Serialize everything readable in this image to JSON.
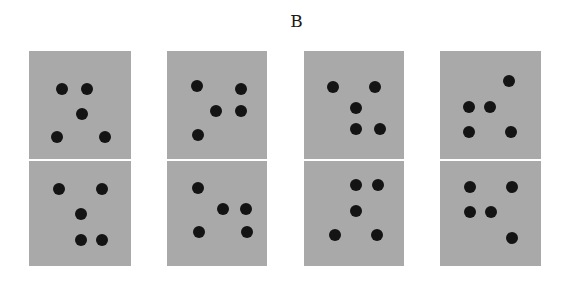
{
  "figure": {
    "label": "B",
    "panel_color": "#a9a9a9",
    "dot_color": "#141414",
    "background": "#ffffff",
    "dot_diameter": 12
  },
  "columns": [
    {
      "top": {
        "x": 29,
        "y": 51,
        "w": 102,
        "h": 108,
        "dots": [
          [
            62,
            89
          ],
          [
            87,
            89
          ],
          [
            82,
            114
          ],
          [
            57,
            137
          ],
          [
            105,
            137
          ]
        ]
      },
      "bottom": {
        "x": 29,
        "y": 161,
        "w": 102,
        "h": 105,
        "dots": [
          [
            59,
            189
          ],
          [
            102,
            189
          ],
          [
            81,
            214
          ],
          [
            81,
            240
          ],
          [
            102,
            240
          ]
        ]
      }
    },
    {
      "top": {
        "x": 167,
        "y": 51,
        "w": 100,
        "h": 108,
        "dots": [
          [
            197,
            86
          ],
          [
            241,
            89
          ],
          [
            216,
            111
          ],
          [
            241,
            111
          ],
          [
            198,
            135
          ]
        ]
      },
      "bottom": {
        "x": 167,
        "y": 161,
        "w": 100,
        "h": 105,
        "dots": [
          [
            198,
            188
          ],
          [
            223,
            209
          ],
          [
            246,
            209
          ],
          [
            199,
            232
          ],
          [
            247,
            232
          ]
        ]
      }
    },
    {
      "top": {
        "x": 304,
        "y": 51,
        "w": 100,
        "h": 108,
        "dots": [
          [
            333,
            87
          ],
          [
            375,
            87
          ],
          [
            356,
            108
          ],
          [
            356,
            129
          ],
          [
            380,
            129
          ]
        ]
      },
      "bottom": {
        "x": 304,
        "y": 161,
        "w": 100,
        "h": 105,
        "dots": [
          [
            356,
            185
          ],
          [
            378,
            185
          ],
          [
            356,
            211
          ],
          [
            335,
            235
          ],
          [
            377,
            235
          ]
        ]
      }
    },
    {
      "top": {
        "x": 440,
        "y": 51,
        "w": 101,
        "h": 108,
        "dots": [
          [
            509,
            81
          ],
          [
            469,
            107
          ],
          [
            490,
            107
          ],
          [
            469,
            132
          ],
          [
            511,
            132
          ]
        ]
      },
      "bottom": {
        "x": 440,
        "y": 161,
        "w": 101,
        "h": 105,
        "dots": [
          [
            470,
            187
          ],
          [
            512,
            187
          ],
          [
            470,
            212
          ],
          [
            491,
            212
          ],
          [
            512,
            238
          ]
        ]
      }
    }
  ]
}
